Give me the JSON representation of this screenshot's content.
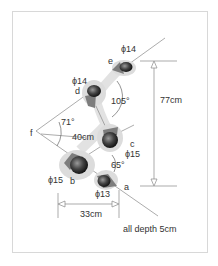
{
  "diagram": {
    "type": "footprint-layout",
    "colors": {
      "frame": "#d8d8d8",
      "line": "#777777",
      "text": "#333333",
      "halo": "#d9d9d9",
      "mid": "#8a8a8a",
      "core": "#2a2a2a"
    },
    "points": [
      {
        "id": "a",
        "label": "a",
        "diameter_label": "ϕ13"
      },
      {
        "id": "b",
        "label": "b",
        "diameter_label": "ϕ15"
      },
      {
        "id": "c",
        "label": "c",
        "diameter_label": "ϕ15"
      },
      {
        "id": "d",
        "label": "d",
        "diameter_label": "ϕ14"
      },
      {
        "id": "e",
        "label": "e",
        "diameter_label": "ϕ14"
      },
      {
        "id": "f",
        "label": "f"
      }
    ],
    "angles": {
      "at_f": "71°",
      "at_c_upper": "105°",
      "at_c_lower": "65°"
    },
    "dimensions": {
      "f_to_c": "40cm",
      "vertical_span": "77cm",
      "horizontal_span": "33cm"
    },
    "note": "all depth 5cm"
  }
}
